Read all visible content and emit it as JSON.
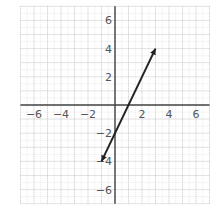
{
  "chart_data": {
    "type": "line",
    "title": "",
    "xlabel": "",
    "ylabel": "",
    "xlim": [
      -7,
      7
    ],
    "ylim": [
      -7,
      7
    ],
    "grid": true,
    "x_ticks": [
      -6,
      -4,
      -2,
      2,
      4,
      6
    ],
    "y_ticks": [
      6,
      4,
      2,
      -2,
      -4,
      -6
    ],
    "x_tick_labels": [
      "−6",
      "−4",
      "−2",
      "2",
      "4",
      "6"
    ],
    "y_tick_labels": [
      "6",
      "4",
      "2",
      "−2",
      "−4",
      "−6"
    ],
    "series": [
      {
        "name": "y = 2x − 2",
        "points": [
          [
            -1,
            -4
          ],
          [
            3,
            4
          ]
        ],
        "arrows": "both",
        "color": "#222222"
      }
    ]
  }
}
